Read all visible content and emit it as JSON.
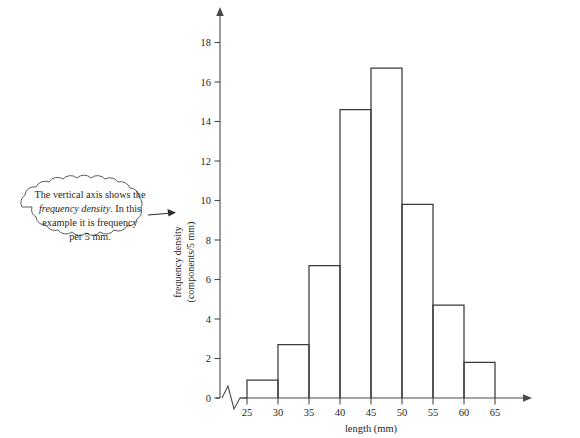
{
  "figure": {
    "name": "frequency-density-histogram",
    "background_color": "#ffffff",
    "line_color": "#3a3a3a",
    "axis_color": "#4a4a4a"
  },
  "chart_data": {
    "type": "bar",
    "title": "",
    "xlabel": "length (mm)",
    "ylabel": "frequency density (components/5 mm)",
    "ylabel_line1": "frequency density",
    "ylabel_line2": "(components/5 mm)",
    "xlim": [
      25,
      65
    ],
    "ylim": [
      0,
      19.5
    ],
    "grid": false,
    "legend": "none",
    "axis_break_x": true,
    "bin_width": 5,
    "x_tick_labels": [
      "25",
      "30",
      "35",
      "40",
      "45",
      "50",
      "55",
      "60",
      "65"
    ],
    "x_ticks": [
      25,
      30,
      35,
      40,
      45,
      50,
      55,
      60,
      65
    ],
    "y_tick_labels": [
      "0",
      "2",
      "4",
      "6",
      "8",
      "10",
      "12",
      "14",
      "16",
      "18"
    ],
    "y_ticks": [
      0,
      2,
      4,
      6,
      8,
      10,
      12,
      14,
      16,
      18
    ],
    "categories": [
      "25-30",
      "30-35",
      "35-40",
      "40-45",
      "45-50",
      "50-55",
      "55-60",
      "60-65"
    ],
    "bin_edges": [
      25,
      30,
      35,
      40,
      45,
      50,
      55,
      60,
      65
    ],
    "values": [
      0.9,
      2.7,
      6.7,
      14.6,
      16.7,
      9.8,
      4.7,
      1.8
    ]
  },
  "callout": {
    "name": "vertical-axis-annotation",
    "line1": "The vertical axis shows the",
    "line2_em": "frequency density",
    "line2_rest": ". In this",
    "line3": "example it is frequency",
    "line4": "per 5 mm."
  }
}
